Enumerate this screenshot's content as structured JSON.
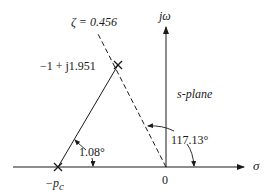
{
  "diagram": {
    "title": "s-plane",
    "axes": {
      "vertical_label": "jω",
      "horizontal_label": "σ",
      "origin_label": "0"
    },
    "points": {
      "closed_loop_pole": {
        "label": "−1 + j1.951",
        "marker": "x-marker-icon"
      },
      "compensator_pole": {
        "label_prefix": "−p",
        "label_subscript": "c",
        "marker": "x-marker-icon"
      }
    },
    "lines": {
      "damping_line_label": "ζ = 0.456",
      "damping_line_style": "dashed"
    },
    "angles": {
      "compensator_angle": "1.08°",
      "pole_angle": "117.13°"
    },
    "colors": {
      "line": "#1a1a1a",
      "background": "#ffffff"
    }
  }
}
